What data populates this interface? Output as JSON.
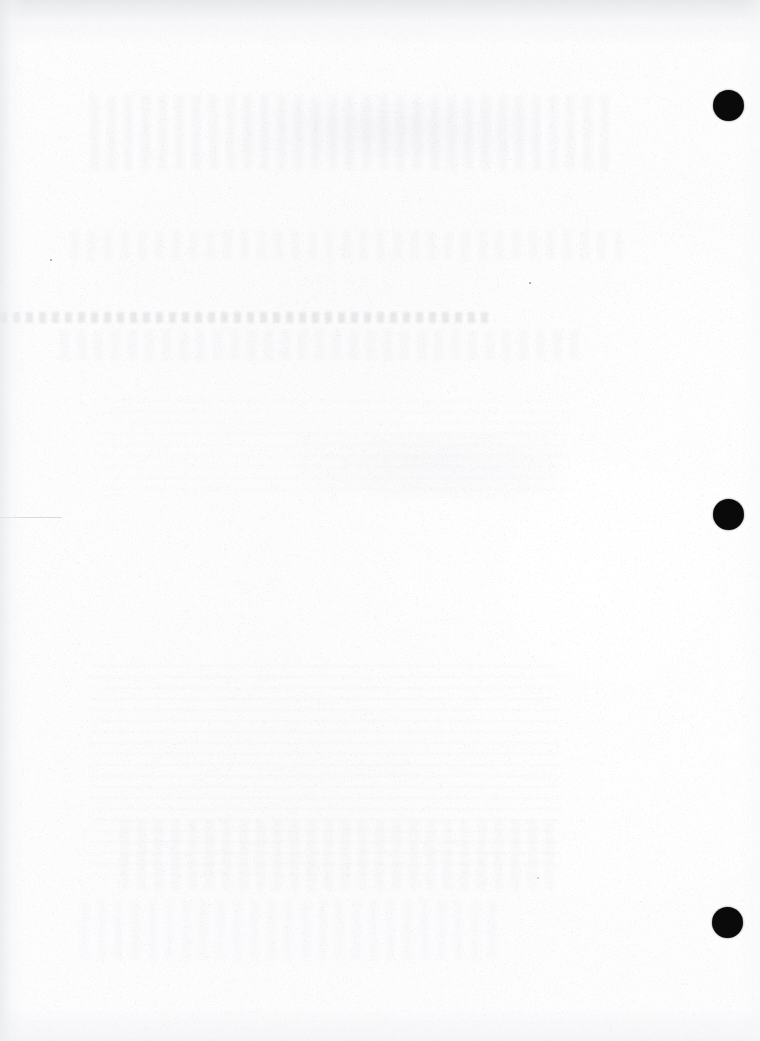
{
  "document": {
    "kind": "scanned-paper-page",
    "content_text": "",
    "note": "Blank scanned sheet — no printed text visible",
    "width": 760,
    "height": 1041,
    "paper_color": "#fdfdfe",
    "ink_color": "#0a0a0a"
  },
  "punch_holes": {
    "count": 3,
    "edge": "right",
    "diameter": 31,
    "color": "#0a0a0a",
    "items": [
      {
        "label": "punch-hole-top",
        "cx": 728,
        "cy": 105,
        "d": 31
      },
      {
        "label": "punch-hole-middle",
        "cx": 728,
        "cy": 514,
        "d": 31
      },
      {
        "label": "punch-hole-bottom",
        "cx": 727,
        "cy": 922,
        "d": 31
      }
    ]
  },
  "show_through": {
    "description": "Faint bleed-through of printing from the reverse side of the sheet",
    "regions": [
      {
        "label": "upper-mottle",
        "x": 90,
        "y": 95,
        "w": 520,
        "h": 75,
        "style": "st-soft",
        "opacity": 0.5
      },
      {
        "label": "upper-patch",
        "x": 240,
        "y": 100,
        "w": 300,
        "h": 60,
        "style": "st-patch",
        "opacity": 0.6
      },
      {
        "label": "mid-soft-line",
        "x": 70,
        "y": 230,
        "w": 560,
        "h": 30,
        "style": "st-soft",
        "opacity": 0.35
      },
      {
        "label": "main-band",
        "x": 0,
        "y": 312,
        "w": 490,
        "h": 11,
        "style": "st-band",
        "opacity": 1.0
      },
      {
        "label": "band-echo",
        "x": 60,
        "y": 330,
        "w": 520,
        "h": 30,
        "style": "st-soft",
        "opacity": 0.45
      },
      {
        "label": "mid-block",
        "x": 100,
        "y": 400,
        "w": 470,
        "h": 90,
        "style": "st-block",
        "opacity": 0.35
      },
      {
        "label": "center-patch",
        "x": 300,
        "y": 430,
        "w": 260,
        "h": 70,
        "style": "st-patch",
        "opacity": 0.45
      },
      {
        "label": "lower-block",
        "x": 90,
        "y": 665,
        "w": 470,
        "h": 210,
        "style": "st-block",
        "opacity": 0.4
      },
      {
        "label": "lower-mottle",
        "x": 120,
        "y": 820,
        "w": 440,
        "h": 70,
        "style": "st-soft",
        "opacity": 0.4
      },
      {
        "label": "bottom-mottle",
        "x": 80,
        "y": 900,
        "w": 420,
        "h": 60,
        "style": "st-soft",
        "opacity": 0.3
      }
    ]
  },
  "faint_rules": [
    {
      "label": "left-rule-fragment",
      "x": 0,
      "y": 517,
      "w": 62,
      "h": 1
    }
  ],
  "specks": [
    {
      "label": "speck-upper-left",
      "x": 51,
      "y": 260,
      "size": 2.5,
      "faint": false
    },
    {
      "label": "speck-upper-mid",
      "x": 530,
      "y": 283,
      "size": 2.5,
      "faint": false
    },
    {
      "label": "speck-lower-mid",
      "x": 538,
      "y": 878,
      "size": 2.0,
      "faint": true
    }
  ]
}
